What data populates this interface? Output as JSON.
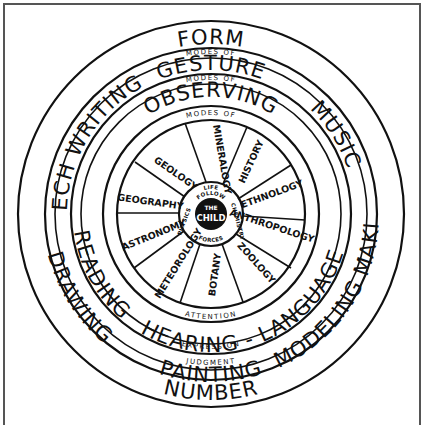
{
  "diagram": {
    "outer_ring": {
      "top": "FORM",
      "bottom": "NUMBER",
      "left": "SPEECH WRITING",
      "right": "MUSIC"
    },
    "band_labels": {
      "modes_of_1": "MODES OF",
      "modes_of_2": "MODES OF",
      "modes_of_3": "MODES OF",
      "expression": "EXPRESSION",
      "judgment": "JUDGMENT",
      "attention": "ATTENTION"
    },
    "second_ring": {
      "top": "GESTURE",
      "bottom": "PAINTING",
      "left": "DRAWING",
      "right": "MODELING MAKING"
    },
    "third_ring": {
      "top": "OBSERVING",
      "bottom": "HEARING - LANGUAGE",
      "left": "READING"
    },
    "spokes": [
      "MINERALOGY",
      "HISTORY",
      "ETHNOLOGY",
      "ANTHROPOLOGY",
      "ZOOLOGY",
      "BOTANY",
      "METEOROLOGY",
      "ASTRONOMY",
      "GEOGRAPHY",
      "GEOLOGY"
    ],
    "hub_ring": {
      "top": "LIFE",
      "inner_top": "FOLLOW",
      "right": "CHEMISTRY",
      "left": "PHYSICS",
      "bottom": "FORCES"
    },
    "center": {
      "line1": "THE",
      "line2": "CHILD"
    }
  }
}
